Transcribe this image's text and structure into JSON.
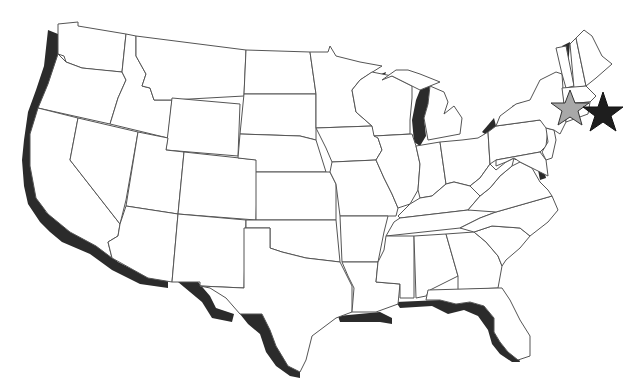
{
  "map": {
    "type": "outline map of contiguous United States",
    "region": "United States (lower 48)",
    "colors": {
      "background": "#ffffff",
      "state_fill": "#ffffff",
      "state_border": "#555555",
      "coast_shadow": "#2b2b2b",
      "star_gray_fill": "#a8a8a8",
      "star_black_fill": "#1e1e1e"
    },
    "markers": [
      {
        "name": "gray-star",
        "shape": "star",
        "color": "#a8a8a8",
        "location": "New England (Massachusetts area)"
      },
      {
        "name": "black-star",
        "shape": "star",
        "color": "#1e1e1e",
        "location": "offshore east of Massachusetts"
      }
    ],
    "highlighted_features": [
      "Pacific coast shadow",
      "Gulf coast shadow",
      "Lake Michigan",
      "Lake Champlain",
      "Chesapeake Bay",
      "Lake Erie shoreline",
      "Puget Sound"
    ]
  }
}
